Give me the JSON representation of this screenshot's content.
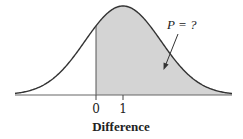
{
  "chart_data": {
    "type": "area",
    "title": "",
    "xlabel": "Difference",
    "ylabel": "",
    "distribution": "normal",
    "mean": 1,
    "x_ticks": [
      0,
      1
    ],
    "x_tick_labels": [
      "0",
      "1"
    ],
    "shaded_region": {
      "from": 0,
      "to": "+inf",
      "description": "area to the right of 0"
    },
    "annotations": [
      {
        "text": "P = ?",
        "points_to": "shaded region"
      }
    ],
    "grid": false,
    "legend": null,
    "colors": {
      "curve": "#333333",
      "shade": "#d4d4d4",
      "axis": "#555555"
    }
  },
  "labels": {
    "tick_0": "0",
    "tick_1": "1",
    "xlabel": "Difference",
    "annotation": "P = ?"
  }
}
